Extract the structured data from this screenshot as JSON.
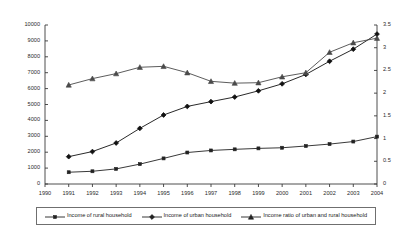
{
  "chart_data": {
    "type": "line",
    "title": "",
    "xlabel": "",
    "ylabel": "",
    "grid": false,
    "legend_position": "bottom",
    "x": [
      1991,
      1992,
      1993,
      1994,
      1995,
      1996,
      1997,
      1998,
      1999,
      2000,
      2001,
      2002,
      2003,
      2004
    ],
    "xticks": [
      "1990",
      "1991",
      "1992",
      "1993",
      "1994",
      "1995",
      "1996",
      "1997",
      "1998",
      "1999",
      "2000",
      "2001",
      "2002",
      "2003",
      "2004"
    ],
    "xlim": [
      1990,
      2004
    ],
    "left_axis": {
      "ylim": [
        0,
        10000
      ],
      "ticks": [
        "0",
        "1000",
        "2000",
        "3000",
        "4000",
        "5000",
        "6000",
        "7000",
        "8000",
        "9000",
        "10000"
      ],
      "tick_values": [
        0,
        1000,
        2000,
        3000,
        4000,
        5000,
        6000,
        7000,
        8000,
        9000,
        10000
      ]
    },
    "right_axis": {
      "ylim": [
        0,
        3.5
      ],
      "ticks": [
        "0",
        "0.5",
        "1",
        "1.5",
        "2",
        "2.5",
        "3",
        "3.5"
      ],
      "tick_values": [
        0,
        0.5,
        1,
        1.5,
        2,
        2.5,
        3,
        3.5
      ]
    },
    "series": [
      {
        "name": "Income of rural household",
        "axis": "left",
        "marker": "square",
        "color": "#222222",
        "values": [
          740,
          800,
          950,
          1250,
          1610,
          1980,
          2110,
          2180,
          2240,
          2280,
          2390,
          2510,
          2670,
          2980
        ]
      },
      {
        "name": "Income of urban household",
        "axis": "left",
        "marker": "diamond",
        "color": "#111111",
        "values": [
          1720,
          2040,
          2580,
          3500,
          4340,
          4880,
          5180,
          5470,
          5860,
          6300,
          6890,
          7720,
          8480,
          9430
        ]
      },
      {
        "name": "Income ratio of urban and rural household",
        "axis": "right",
        "marker": "triangle",
        "color": "#4a4a4a",
        "values": [
          2.18,
          2.32,
          2.43,
          2.57,
          2.59,
          2.45,
          2.26,
          2.22,
          2.23,
          2.36,
          2.45,
          2.9,
          3.11,
          3.21
        ]
      }
    ]
  },
  "legend": {
    "items": [
      {
        "label": "Income of rural household",
        "marker": "square"
      },
      {
        "label": "Income of urban household",
        "marker": "diamond"
      },
      {
        "label": "Income ratio of urban and rural household",
        "marker": "triangle"
      }
    ]
  }
}
